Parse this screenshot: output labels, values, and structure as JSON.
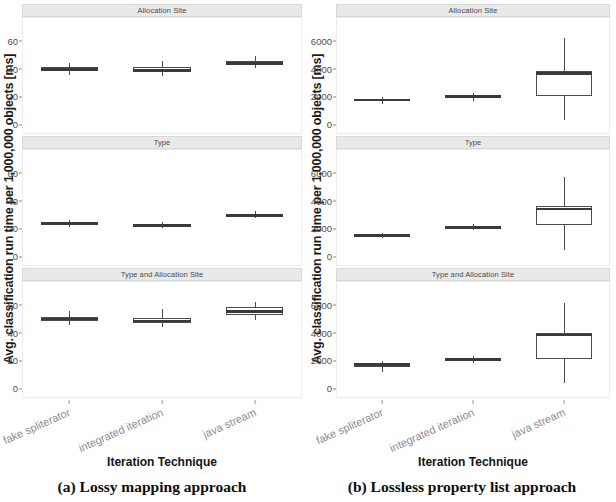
{
  "figure": {
    "subfigures": [
      {
        "id": "a",
        "caption": "(a) Lossy mapping approach",
        "y_axis_title": "Avg. classification run time per 1,000,000 objects [ms]",
        "x_axis_title": "Iteration Technique",
        "y_ticks": [
          "0",
          "20",
          "40",
          "60"
        ],
        "x_categories": [
          "fake spliterator",
          "integrated iteration",
          "java stream"
        ],
        "panels": [
          "Allocation Site",
          "Type",
          "Type and Allocation Site"
        ]
      },
      {
        "id": "b",
        "caption": "(b) Lossless property list approach",
        "y_axis_title": "Avg. classification run time per 1,000,000 objects [ms]",
        "x_axis_title": "Iteration Technique",
        "y_ticks": [
          "0",
          "2000",
          "4000",
          "6000"
        ],
        "x_categories": [
          "fake spliterator",
          "integrated iteration",
          "java stream"
        ],
        "panels": [
          "Allocation Site",
          "Type",
          "Type and Allocation Site"
        ]
      }
    ]
  },
  "chart_data": [
    {
      "type": "box",
      "subfigure": "a",
      "title": "(a) Lossy mapping approach",
      "xlabel": "Iteration Technique",
      "ylabel": "Avg. classification run time per 1,000,000 objects [ms]",
      "ylim": [
        0,
        70
      ],
      "yticks": [
        0,
        20,
        40,
        60
      ],
      "grid": false,
      "legend": "none",
      "facets": [
        {
          "name": "Allocation Site",
          "categories": [
            "fake spliterator",
            "integrated iteration",
            "java stream"
          ],
          "boxes": [
            {
              "category": "fake spliterator",
              "min": 36.0,
              "q1": 39.0,
              "median": 40.0,
              "q3": 41.5,
              "max": 45.0
            },
            {
              "category": "integrated iteration",
              "min": 35.0,
              "q1": 38.0,
              "median": 39.5,
              "q3": 41.5,
              "max": 46.0
            },
            {
              "category": "java stream",
              "min": 41.0,
              "q1": 43.0,
              "median": 44.5,
              "q3": 46.0,
              "max": 50.0
            }
          ]
        },
        {
          "name": "Type",
          "categories": [
            "fake spliterator",
            "integrated iteration",
            "java stream"
          ],
          "boxes": [
            {
              "category": "fake spliterator",
              "min": 22.0,
              "q1": 23.0,
              "median": 24.0,
              "q3": 25.0,
              "max": 27.0
            },
            {
              "category": "integrated iteration",
              "min": 21.0,
              "q1": 22.0,
              "median": 22.8,
              "q3": 23.5,
              "max": 25.0
            },
            {
              "category": "java stream",
              "min": 28.0,
              "q1": 29.0,
              "median": 30.0,
              "q3": 31.0,
              "max": 33.5
            }
          ]
        },
        {
          "name": "Type and Allocation Site",
          "categories": [
            "fake spliterator",
            "integrated iteration",
            "java stream"
          ],
          "boxes": [
            {
              "category": "fake spliterator",
              "min": 46.0,
              "q1": 49.0,
              "median": 50.5,
              "q3": 52.0,
              "max": 56.0
            },
            {
              "category": "integrated iteration",
              "min": 45.0,
              "q1": 47.5,
              "median": 49.0,
              "q3": 51.5,
              "max": 58.0
            },
            {
              "category": "java stream",
              "min": 50.0,
              "q1": 53.5,
              "median": 56.0,
              "q3": 59.0,
              "max": 63.0
            }
          ]
        }
      ]
    },
    {
      "type": "box",
      "subfigure": "b",
      "title": "(b) Lossless property list approach",
      "xlabel": "Iteration Technique",
      "ylabel": "Avg. classification run time per 1,000,000 objects [ms]",
      "ylim": [
        0,
        7000
      ],
      "yticks": [
        0,
        2000,
        4000,
        6000
      ],
      "grid": false,
      "legend": "none",
      "facets": [
        {
          "name": "Allocation Site",
          "categories": [
            "fake spliterator",
            "integrated iteration",
            "java stream"
          ],
          "boxes": [
            {
              "category": "fake spliterator",
              "min": 1500,
              "q1": 1700,
              "median": 1800,
              "q3": 1900,
              "max": 2050
            },
            {
              "category": "integrated iteration",
              "min": 1750,
              "q1": 1950,
              "median": 2050,
              "q3": 2150,
              "max": 2300
            },
            {
              "category": "java stream",
              "min": 350,
              "q1": 2100,
              "median": 3700,
              "q3": 3900,
              "max": 6300
            }
          ]
        },
        {
          "name": "Type",
          "categories": [
            "fake spliterator",
            "integrated iteration",
            "java stream"
          ],
          "boxes": [
            {
              "category": "fake spliterator",
              "min": 1400,
              "q1": 1500,
              "median": 1560,
              "q3": 1620,
              "max": 1750
            },
            {
              "category": "integrated iteration",
              "min": 1950,
              "q1": 2080,
              "median": 2150,
              "q3": 2230,
              "max": 2350
            },
            {
              "category": "java stream",
              "min": 500,
              "q1": 2300,
              "median": 3450,
              "q3": 3650,
              "max": 5800
            }
          ]
        },
        {
          "name": "Type and Allocation Site",
          "categories": [
            "fake spliterator",
            "integrated iteration",
            "java stream"
          ],
          "boxes": [
            {
              "category": "fake spliterator",
              "min": 1200,
              "q1": 1600,
              "median": 1750,
              "q3": 1880,
              "max": 2000
            },
            {
              "category": "integrated iteration",
              "min": 1900,
              "q1": 2020,
              "median": 2120,
              "q3": 2220,
              "max": 2350
            },
            {
              "category": "java stream",
              "min": 450,
              "q1": 2200,
              "median": 3900,
              "q3": 4050,
              "max": 6200
            }
          ]
        }
      ]
    }
  ],
  "style": {
    "strip_bg": "#e9e9e9",
    "panel_bg": "#ffffff",
    "box_stroke": "#4b4b4b",
    "tick_color": "#4d4d4d",
    "xlabel_color": "#8d8d8d"
  }
}
